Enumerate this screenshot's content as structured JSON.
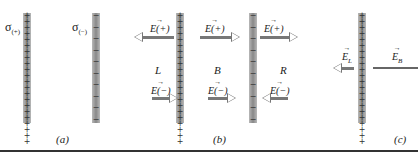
{
  "panel_a": {
    "sigma_pos": "σ",
    "sigma_pos_sub": "(+)",
    "sigma_neg": "σ",
    "sigma_neg_sub": "(−)",
    "caption": "(a)"
  },
  "panel_b": {
    "E_plus": "E(+)",
    "E_minus": "E(−)",
    "regions": [
      "L",
      "B",
      "R"
    ],
    "caption": "(b)"
  },
  "panel_c": {
    "E_L": "E_L",
    "E_B": "E_B",
    "caption": "(c)"
  },
  "signs": {
    "plus": "+",
    "minus": "−"
  }
}
